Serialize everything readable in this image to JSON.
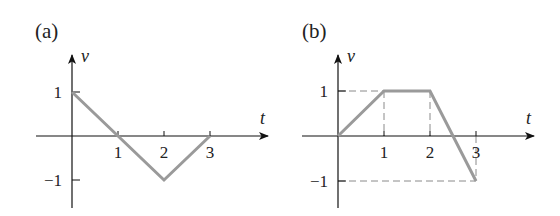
{
  "chart_data": [
    {
      "type": "line",
      "panel_label": "(a)",
      "xlabel": "t",
      "ylabel": "v",
      "x_ticks": [
        "1",
        "2",
        "3"
      ],
      "y_ticks": [
        "1",
        "−1"
      ],
      "series": [
        {
          "name": "v(t)",
          "x": [
            0,
            1,
            2,
            3
          ],
          "y": [
            1,
            0,
            -1,
            0
          ]
        }
      ],
      "xlim": [
        -0.8,
        4.3
      ],
      "ylim": [
        -1.6,
        1.8
      ],
      "guides": false,
      "line_color": "#9a9a9a"
    },
    {
      "type": "line",
      "panel_label": "(b)",
      "xlabel": "t",
      "ylabel": "v",
      "x_ticks": [
        "1",
        "2",
        "3"
      ],
      "y_ticks": [
        "1",
        "−1"
      ],
      "series": [
        {
          "name": "v(t)",
          "x": [
            0,
            1,
            2,
            3
          ],
          "y": [
            0,
            1,
            1,
            -1
          ]
        }
      ],
      "xlim": [
        -0.8,
        4.3
      ],
      "ylim": [
        -1.6,
        1.8
      ],
      "guides": true,
      "line_color": "#9a9a9a"
    }
  ]
}
